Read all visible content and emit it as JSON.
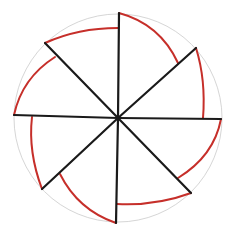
{
  "diagram": {
    "title": "",
    "colors": {
      "background": "#ffffff",
      "outer_circle": "#d6d6d6",
      "radial_lines": "#1a1a1a",
      "arcs": "#c62f2a"
    },
    "center": [
      118,
      118
    ],
    "outer_radius": 104,
    "spokes": [
      {
        "name": "spoke-top",
        "x2": 119,
        "y2": 13
      },
      {
        "name": "spoke-top-right",
        "x2": 196,
        "y2": 48
      },
      {
        "name": "spoke-right",
        "x2": 221,
        "y2": 119
      },
      {
        "name": "spoke-bottom-right",
        "x2": 191,
        "y2": 193
      },
      {
        "name": "spoke-bottom",
        "x2": 116,
        "y2": 223
      },
      {
        "name": "spoke-bottom-left",
        "x2": 42,
        "y2": 189
      },
      {
        "name": "spoke-left",
        "x2": 14,
        "y2": 115
      },
      {
        "name": "spoke-top-left",
        "x2": 45,
        "y2": 43
      }
    ],
    "arcs": [
      {
        "name": "arc-top-right",
        "d": "M119 13 Q160 24 178 63"
      },
      {
        "name": "arc-right-upper",
        "d": "M196 48 Q206 80 203 118"
      },
      {
        "name": "arc-right-lower",
        "d": "M221 119 Q214 156 178 178"
      },
      {
        "name": "arc-bottom-right",
        "d": "M191 193 Q156 206 117 204"
      },
      {
        "name": "arc-bottom-left",
        "d": "M116 223 Q78 210 60 174"
      },
      {
        "name": "arc-left-lower",
        "d": "M42 189 Q28 152 32 117"
      },
      {
        "name": "arc-left-upper",
        "d": "M14 115 Q22 78 55 57"
      },
      {
        "name": "arc-top-left",
        "d": "M45 43 Q78 28 118 28"
      }
    ]
  }
}
